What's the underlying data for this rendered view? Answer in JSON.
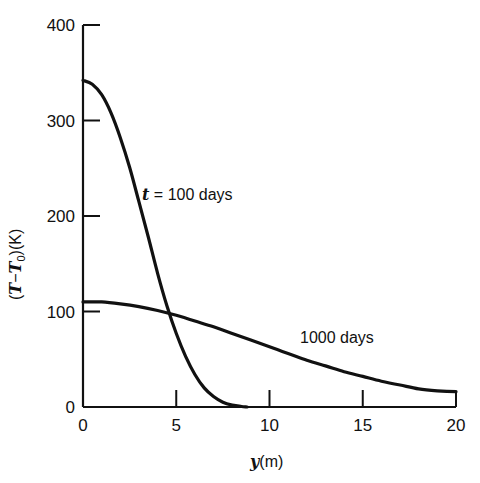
{
  "chart_data": {
    "type": "line",
    "title": "",
    "xlabel": "y(m)",
    "xlabel_var": "y",
    "xlabel_unit": "(m)",
    "ylabel": "(T−T0)(K)",
    "ylabel_parts": {
      "open": "(",
      "T": "T",
      "minus": "−",
      "T0": "T",
      "sub": "0",
      "close": ")",
      "unit": "(K)"
    },
    "xlim": [
      0,
      20
    ],
    "ylim": [
      0,
      400
    ],
    "xticks": [
      0,
      5,
      10,
      15,
      20
    ],
    "yticks": [
      0,
      100,
      200,
      300,
      400
    ],
    "xtick_labels": [
      "0",
      "5",
      "10",
      "15",
      "20"
    ],
    "ytick_labels": [
      "0",
      "100",
      "200",
      "300",
      "400"
    ],
    "grid": false,
    "legend": "none (inline annotations)",
    "series": [
      {
        "name": "t = 100 days",
        "label_var": "t",
        "label_rest": " = 100 days",
        "x": [
          0,
          0.5,
          1,
          1.5,
          2,
          2.5,
          3,
          3.5,
          4,
          4.5,
          5,
          5.5,
          6,
          6.5,
          7,
          7.5,
          8,
          8.5,
          8.8
        ],
        "y": [
          342,
          338,
          327,
          308,
          282,
          251,
          215,
          178,
          140,
          106,
          77,
          53,
          34,
          20,
          11,
          5,
          2,
          0.5,
          0
        ]
      },
      {
        "name": "1000 days",
        "x": [
          0,
          1,
          2,
          3,
          4,
          5,
          6,
          7,
          8,
          9,
          10,
          11,
          12,
          13,
          14,
          15,
          16,
          17,
          18,
          19,
          20
        ],
        "y": [
          110,
          110,
          108,
          105,
          101,
          96,
          90,
          84,
          77,
          70,
          63,
          56,
          49,
          43,
          37,
          32,
          27,
          23,
          19,
          17,
          16
        ]
      }
    ],
    "annotations": [
      {
        "text": "t = 100 days",
        "x": 3.4,
        "y": 225
      },
      {
        "text": "1000 days",
        "x": 11.8,
        "y": 72
      }
    ]
  }
}
